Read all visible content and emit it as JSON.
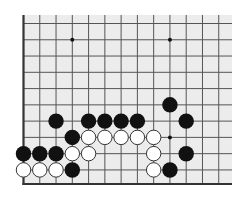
{
  "board": {
    "title": "Go board fragment (bottom-left corner region)",
    "background_color": "#ececec",
    "line_color": "#555555",
    "edge_color": "#333333",
    "black_color": "#111111",
    "white_color": "#ffffff",
    "stone_outline": "#333333",
    "area": {
      "left": 23.5,
      "top": 15,
      "right": 232,
      "bottom": 184
    },
    "origin": {
      "x": 23.5,
      "y": 23.5
    },
    "spacing": 16.27,
    "columns": 13,
    "rows": 11,
    "edges": {
      "left": true,
      "bottom": true,
      "top": false,
      "right": false
    },
    "star_points": [
      {
        "c": 3,
        "r": 1
      },
      {
        "c": 9,
        "r": 1
      },
      {
        "c": 9,
        "r": 7
      }
    ],
    "stones": [
      {
        "color": "black",
        "c": 9,
        "r": 5
      },
      {
        "color": "black",
        "c": 2,
        "r": 6
      },
      {
        "color": "black",
        "c": 4,
        "r": 6
      },
      {
        "color": "black",
        "c": 5,
        "r": 6
      },
      {
        "color": "black",
        "c": 6,
        "r": 6
      },
      {
        "color": "black",
        "c": 7,
        "r": 6
      },
      {
        "color": "black",
        "c": 10,
        "r": 6
      },
      {
        "color": "black",
        "c": 3,
        "r": 7
      },
      {
        "color": "white",
        "c": 4,
        "r": 7
      },
      {
        "color": "white",
        "c": 5,
        "r": 7
      },
      {
        "color": "white",
        "c": 6,
        "r": 7
      },
      {
        "color": "white",
        "c": 7,
        "r": 7
      },
      {
        "color": "white",
        "c": 8,
        "r": 7
      },
      {
        "color": "black",
        "c": 0,
        "r": 8
      },
      {
        "color": "black",
        "c": 1,
        "r": 8
      },
      {
        "color": "black",
        "c": 2,
        "r": 8
      },
      {
        "color": "white",
        "c": 3,
        "r": 8
      },
      {
        "color": "white",
        "c": 4,
        "r": 8
      },
      {
        "color": "white",
        "c": 8,
        "r": 8
      },
      {
        "color": "black",
        "c": 10,
        "r": 8
      },
      {
        "color": "white",
        "c": 0,
        "r": 9
      },
      {
        "color": "white",
        "c": 1,
        "r": 9
      },
      {
        "color": "white",
        "c": 2,
        "r": 9
      },
      {
        "color": "black",
        "c": 3,
        "r": 9
      },
      {
        "color": "white",
        "c": 8,
        "r": 9
      },
      {
        "color": "black",
        "c": 9,
        "r": 9
      }
    ]
  }
}
